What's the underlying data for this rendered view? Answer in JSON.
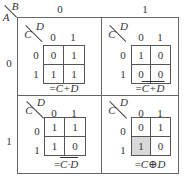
{
  "outer": {
    "row_var": "A",
    "col_var": "B",
    "col_headers": [
      "0",
      "1"
    ],
    "row_headers": [
      "0",
      "1"
    ]
  },
  "maps": [
    {
      "id": "a0b0",
      "row_var": "C",
      "col_var": "D",
      "col_headers": [
        "0",
        "1"
      ],
      "row_headers": [
        "0",
        "1"
      ],
      "cells": [
        [
          "0",
          "1"
        ],
        [
          "1",
          "1"
        ]
      ],
      "label_prefix": "=",
      "label_expr": "C+D",
      "label_overline": "",
      "shaded": []
    },
    {
      "id": "a0b1",
      "row_var": "C",
      "col_var": "D",
      "col_headers": [
        "0",
        "1"
      ],
      "row_headers": [
        "0",
        "1"
      ],
      "cells": [
        [
          "1",
          "0"
        ],
        [
          "0",
          "0"
        ]
      ],
      "label_prefix": "=",
      "label_expr": "",
      "label_overline": "C+D",
      "shaded": []
    },
    {
      "id": "a1b0",
      "row_var": "C",
      "col_var": "D",
      "col_headers": [
        "0",
        "1"
      ],
      "row_headers": [
        "0",
        "1"
      ],
      "cells": [
        [
          "1",
          "1"
        ],
        [
          "1",
          "0"
        ]
      ],
      "label_prefix": "=",
      "label_expr": "",
      "label_overline": "C·D",
      "shaded": []
    },
    {
      "id": "a1b1",
      "row_var": "C",
      "col_var": "D",
      "col_headers": [
        "0",
        "1"
      ],
      "row_headers": [
        "0",
        "1"
      ],
      "cells": [
        [
          "0",
          "1"
        ],
        [
          "1",
          "0"
        ]
      ],
      "label_prefix": "=",
      "label_expr": "C⊕D",
      "label_overline": "",
      "shaded": [
        [
          1,
          0
        ]
      ],
      "shade_color": "#d9d9d9"
    }
  ]
}
